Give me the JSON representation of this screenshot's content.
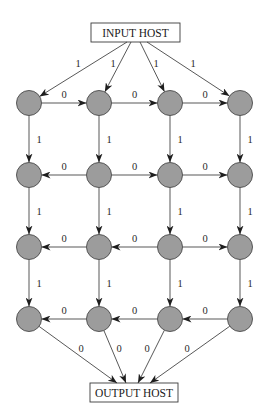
{
  "diagram": {
    "input_host": {
      "label": "INPUT HOST"
    },
    "output_host": {
      "label": "OUTPUT HOST"
    },
    "colors": {
      "node_fill": "#9c9c9c",
      "node_stroke": "#4a4a4a",
      "edge": "#3a3a3a",
      "background": "#ffffff"
    },
    "grid": {
      "rows": 4,
      "cols": 4
    },
    "nodes": [
      {
        "id": "n11"
      },
      {
        "id": "n12"
      },
      {
        "id": "n13"
      },
      {
        "id": "n14"
      },
      {
        "id": "n21"
      },
      {
        "id": "n22"
      },
      {
        "id": "n23"
      },
      {
        "id": "n24"
      },
      {
        "id": "n31"
      },
      {
        "id": "n32"
      },
      {
        "id": "n33"
      },
      {
        "id": "n34"
      },
      {
        "id": "n41"
      },
      {
        "id": "n42"
      },
      {
        "id": "n43"
      },
      {
        "id": "n44"
      }
    ],
    "edges": [
      {
        "from": "input",
        "to": "n11",
        "weight": "1"
      },
      {
        "from": "input",
        "to": "n12",
        "weight": "1"
      },
      {
        "from": "input",
        "to": "n13",
        "weight": "1"
      },
      {
        "from": "input",
        "to": "n14",
        "weight": "1"
      },
      {
        "from": "n11",
        "to": "n12",
        "weight": "0"
      },
      {
        "from": "n12",
        "to": "n13",
        "weight": "0"
      },
      {
        "from": "n13",
        "to": "n14",
        "weight": "0"
      },
      {
        "from": "n11",
        "to": "n21",
        "weight": "1"
      },
      {
        "from": "n12",
        "to": "n22",
        "weight": "1"
      },
      {
        "from": "n13",
        "to": "n23",
        "weight": "1"
      },
      {
        "from": "n14",
        "to": "n24",
        "weight": "1"
      },
      {
        "from": "n22",
        "to": "n21",
        "weight": "0"
      },
      {
        "from": "n22",
        "to": "n23",
        "weight": "0"
      },
      {
        "from": "n23",
        "to": "n24",
        "weight": "0"
      },
      {
        "from": "n21",
        "to": "n31",
        "weight": "1"
      },
      {
        "from": "n22",
        "to": "n32",
        "weight": "1"
      },
      {
        "from": "n23",
        "to": "n33",
        "weight": "1"
      },
      {
        "from": "n24",
        "to": "n34",
        "weight": "1"
      },
      {
        "from": "n32",
        "to": "n31",
        "weight": "0"
      },
      {
        "from": "n33",
        "to": "n32",
        "weight": "0"
      },
      {
        "from": "n33",
        "to": "n34",
        "weight": "0"
      },
      {
        "from": "n31",
        "to": "n41",
        "weight": "1"
      },
      {
        "from": "n32",
        "to": "n42",
        "weight": "1"
      },
      {
        "from": "n33",
        "to": "n43",
        "weight": "1"
      },
      {
        "from": "n34",
        "to": "n44",
        "weight": "1"
      },
      {
        "from": "n42",
        "to": "n41",
        "weight": "0"
      },
      {
        "from": "n43",
        "to": "n42",
        "weight": "0"
      },
      {
        "from": "n44",
        "to": "n43",
        "weight": "0"
      },
      {
        "from": "n41",
        "to": "output",
        "weight": "0"
      },
      {
        "from": "n42",
        "to": "output",
        "weight": "0"
      },
      {
        "from": "n43",
        "to": "output",
        "weight": "0"
      },
      {
        "from": "n44",
        "to": "output",
        "weight": "0"
      }
    ]
  }
}
